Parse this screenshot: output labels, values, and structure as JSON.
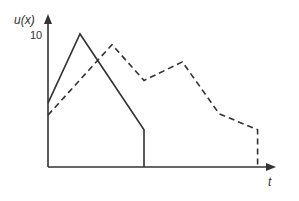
{
  "chart_data": {
    "type": "line",
    "title": "",
    "xlabel": "t",
    "ylabel": "u(x)",
    "yticks": [
      "10"
    ],
    "ylim": [
      0,
      10
    ],
    "grid": false,
    "legend": null,
    "series": [
      {
        "name": "solid",
        "style": "solid",
        "color": "#333333",
        "points": [
          [
            0,
            4.8
          ],
          [
            2.0,
            10
          ],
          [
            6.0,
            2.8
          ],
          [
            6.0,
            0
          ]
        ]
      },
      {
        "name": "dashed",
        "style": "dashed",
        "color": "#333333",
        "points": [
          [
            0,
            3.9
          ],
          [
            4.0,
            9.2
          ],
          [
            6.0,
            6.5
          ],
          [
            8.4,
            7.9
          ],
          [
            10.7,
            4.0
          ],
          [
            13.1,
            2.8
          ],
          [
            13.1,
            0
          ]
        ]
      }
    ]
  },
  "labels": {
    "ylabel": "u(x)",
    "ytick": "10",
    "xlabel": "t"
  }
}
